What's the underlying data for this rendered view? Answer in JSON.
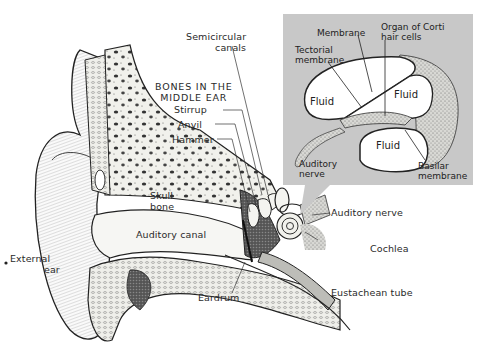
{
  "diagram": {
    "colors": {
      "background": "#ffffff",
      "inset_panel": "#c8c8c8",
      "ink": "#2a2a2a",
      "bone_fill": "#eeeeea",
      "fluid_fill": "#ffffff"
    },
    "main_labels": {
      "semicircular_canals": [
        "Semicircular",
        "canals"
      ],
      "bones_title": [
        "BONES IN THE",
        "MIDDLE EAR"
      ],
      "stirrup": "Stirrup",
      "anvil": "Anvil",
      "hammer": "Hammer",
      "skull_bone": [
        "Skull",
        "bone"
      ],
      "auditory_canal": "Auditory canal",
      "external_ear": [
        "External",
        "ear"
      ],
      "eardrum": "Eardrum",
      "auditory_nerve": "Auditory nerve",
      "cochlea": "Cochlea",
      "eustachean_tube": "Eustachean tube"
    },
    "inset": {
      "title": "Cochlea cross-section detail",
      "labels": {
        "membrane": "Membrane",
        "organ_of_corti": [
          "Organ of Corti",
          "hair cells"
        ],
        "tectorial_membrane": [
          "Tectorial",
          "membrane"
        ],
        "fluid_left": "Fluid",
        "fluid_right": "Fluid",
        "fluid_bottom": "Fluid",
        "auditory_nerve": [
          "Auditory",
          "nerve"
        ],
        "basilar_membrane": [
          "Basilar",
          "membrane"
        ]
      }
    }
  }
}
